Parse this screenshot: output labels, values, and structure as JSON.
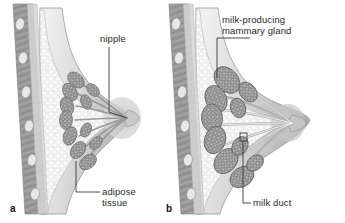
{
  "figure": {
    "background": "#fefefe",
    "ink": "#2b2b2b"
  },
  "panels": [
    {
      "letter": "a",
      "caption": "non-lactating breast"
    },
    {
      "letter": "b",
      "caption": "lactating breast"
    }
  ],
  "labels": {
    "nipple": "nipple",
    "mammary_gland_line1": "milk-producing",
    "mammary_gland_line2": "mammary gland",
    "adipose_line1": "adipose",
    "adipose_line2": "tissue",
    "milk_duct": "milk duct"
  },
  "colors": {
    "chest_wall_dark": "#8e8e8e",
    "chest_wall_mid": "#a7a7a7",
    "rib_light": "#e3e3e3",
    "adipose_fill": "#ebebeb",
    "breast_skin": "#d8d8d8",
    "breast_shade": "#bdbdbd",
    "lobule_gray": "#8a8a8a",
    "lobule_dark": "#6f6f6f",
    "duct_light": "#f2f2f2",
    "outline": "#6a6a6a",
    "leader": "#3a3a3a"
  }
}
